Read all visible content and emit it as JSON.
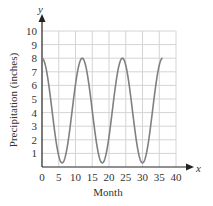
{
  "chart_data": {
    "type": "line",
    "title": "",
    "xlabel": "Month",
    "ylabel": "Precipitation (inches)",
    "x_axis_name": "x",
    "y_axis_name": "y",
    "xlim": [
      0,
      40
    ],
    "ylim": [
      0,
      10
    ],
    "x_ticks": [
      0,
      5,
      10,
      15,
      20,
      25,
      30,
      35,
      40
    ],
    "y_ticks": [
      1,
      2,
      3,
      4,
      5,
      6,
      7,
      8,
      9,
      10
    ],
    "grid": true,
    "legend": null,
    "series": [
      {
        "name": "Precipitation",
        "color": "#808080",
        "model": "y = 4.15 + 3.85*cos(pi*x/6)",
        "x": [
          0,
          3,
          6,
          9,
          12,
          15,
          18,
          21,
          24,
          27,
          30,
          33,
          36
        ],
        "values": [
          8,
          4.15,
          0.3,
          4.15,
          8,
          4.15,
          0.3,
          4.15,
          8,
          4.15,
          0.3,
          4.15,
          8
        ]
      }
    ]
  },
  "labels": {
    "xlabel": "Month",
    "ylabel": "Precipitation (inches)",
    "x_axis_name": "x",
    "y_axis_name": "y"
  }
}
